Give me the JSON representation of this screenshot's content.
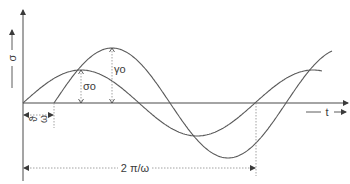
{
  "figure": {
    "type": "phase-shifted sinusoids (stress/strain)",
    "axes": {
      "y_label": "σ",
      "x_label": "t"
    },
    "curves": [
      {
        "name": "sigma-curve",
        "label": "σ₀",
        "amplitude_label": "σo",
        "phase_shift": 0
      },
      {
        "name": "gamma-curve",
        "label": "γ₀",
        "amplitude_label": "γo",
        "phase_shift_label": "ϑ/ω"
      }
    ],
    "annotations": {
      "sigma_amplitude": "σo",
      "gamma_amplitude": "γo",
      "phase_shift": "ϑ/ω",
      "phase_shift_num": "ϑ",
      "phase_shift_den": "ω",
      "period": "2 π/ω"
    },
    "colors": {
      "line": "#5a5a5a",
      "axis": "#4a4a4a",
      "dotted": "#8a8a8a"
    }
  }
}
